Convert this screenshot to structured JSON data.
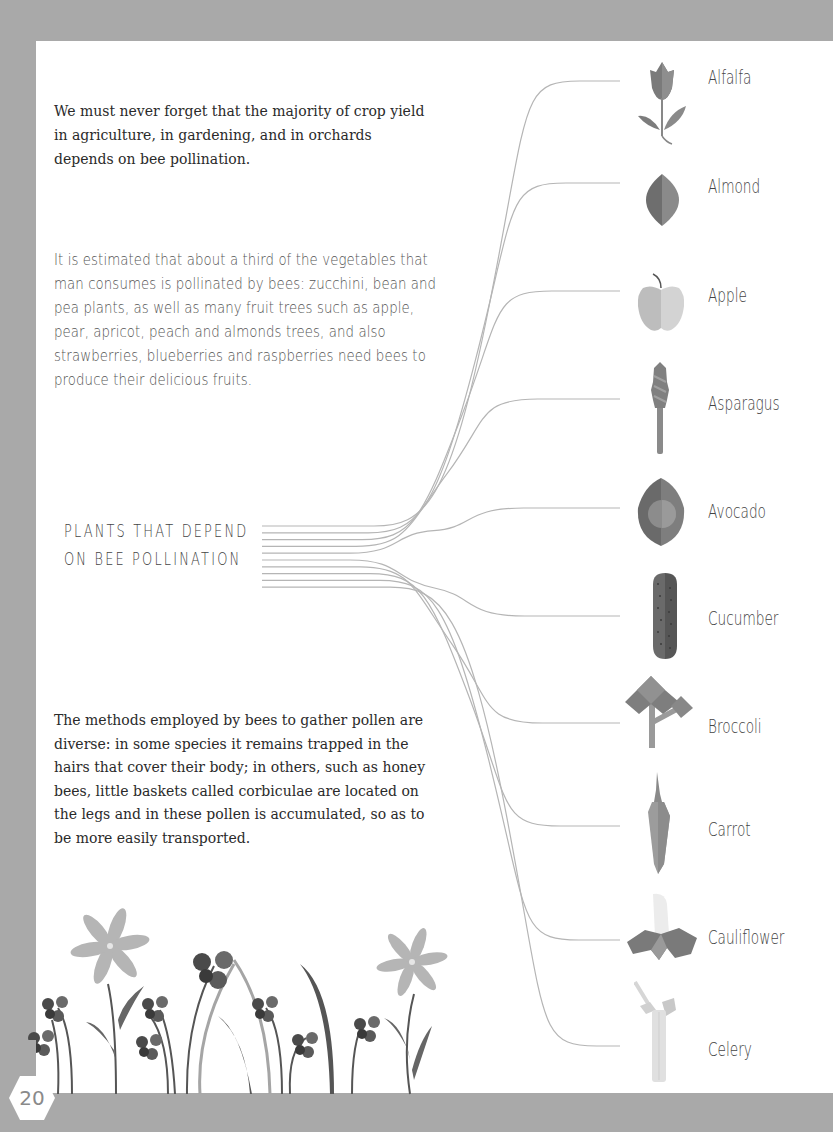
{
  "page": {
    "intro_text": "We must never forget that the majority of crop yield in agriculture, in gardening, and in orchards depends on bee pollination.",
    "estimate_text": "It is estimated that about a third of the vegetables that man consumes is pollinated by bees: zucchini, bean and pea plants, as well as many fruit trees such as apple, pear, apricot, peach and almonds trees, and also strawberries, blueberries and raspberries need bees to produce their delicious fruits.",
    "heading_line1": "PLANTS THAT DEPEND",
    "heading_line2": "ON BEE POLLINATION",
    "methods_text": "The methods employed by bees to gather pollen are diverse: in some species it remains trapped in the hairs that cover their body; in others, such as honey bees, little baskets called corbiculae are located on the legs and in these pollen is accumulated, so as to be more easily transported.",
    "page_number": "20"
  },
  "plants": [
    {
      "name": "Alfalfa",
      "icon": "alfalfa-icon",
      "y": 81
    },
    {
      "name": "Almond",
      "icon": "almond-icon",
      "y": 183
    },
    {
      "name": "Apple",
      "icon": "apple-icon",
      "y": 291
    },
    {
      "name": "Asparagus",
      "icon": "asparagus-icon",
      "y": 399
    },
    {
      "name": "Avocado",
      "icon": "avocado-icon",
      "y": 508
    },
    {
      "name": "Cucumber",
      "icon": "cucumber-icon",
      "y": 616
    },
    {
      "name": "Broccoli",
      "icon": "broccoli-icon",
      "y": 723
    },
    {
      "name": "Carrot",
      "icon": "carrot-icon",
      "y": 826
    },
    {
      "name": "Cauliflower",
      "icon": "cauliflower-icon",
      "y": 940
    },
    {
      "name": "Celery",
      "icon": "celery-icon",
      "y": 1046
    }
  ],
  "colors": {
    "frame": "#a9a9a9",
    "page": "#ffffff",
    "line": "#b5b5b5",
    "icon_dark": "#6e6e6e",
    "icon_mid": "#8c8c8c",
    "icon_light": "#c4c4c4"
  }
}
